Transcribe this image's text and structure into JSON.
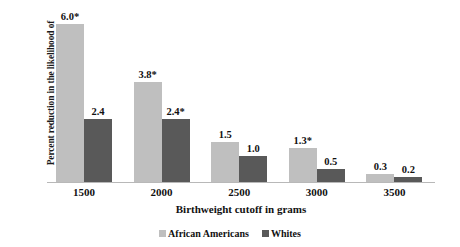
{
  "chart_data": {
    "type": "bar",
    "title": "",
    "categories": [
      "1500",
      "2000",
      "2500",
      "3000",
      "3500"
    ],
    "series": [
      {
        "name": "African Americans",
        "color": "#bfbfbf",
        "values": [
          6.0,
          3.8,
          1.5,
          1.3,
          0.3
        ],
        "labels": [
          "6.0*",
          "3.8*",
          "1.5",
          "1.3*",
          "0.3"
        ]
      },
      {
        "name": "Whites",
        "color": "#595959",
        "values": [
          2.4,
          2.4,
          1.0,
          0.5,
          0.2
        ],
        "labels": [
          "2.4",
          "2.4*",
          "1.0",
          "0.5",
          "0.2"
        ]
      }
    ],
    "xlabel": "Birthweight cutoff in grams",
    "ylabel": "Percent reduction in the likelihood of birthweight under given cutoff",
    "ylim": [
      0,
      6.6
    ],
    "grid": false,
    "legend_position": "bottom",
    "axis_line_color": "#b8b8b8",
    "background": "#ffffff"
  },
  "legend": {
    "items": [
      {
        "label": "African Americans",
        "swatch": "#bfbfbf"
      },
      {
        "label": "Whites",
        "swatch": "#595959"
      }
    ]
  }
}
